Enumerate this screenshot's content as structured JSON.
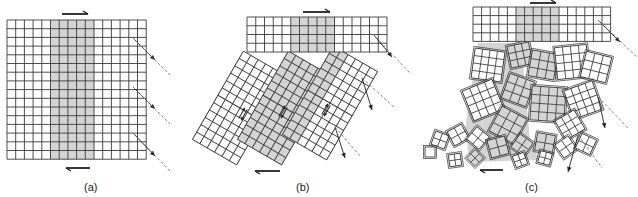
{
  "figure": {
    "colors": {
      "grid_line": "#3a3a3a",
      "shade": "#d4d4d4",
      "background": "#ffffff",
      "arrow": "#222222",
      "dashed": "#777777"
    },
    "panels": [
      {
        "id": "a",
        "label": "(a)",
        "label_pos": [
          84,
          181
        ],
        "description": "Intact rock mass grid with shaded vertical band; shear arrows top and bottom; three outward arrows on right with dashed extensions",
        "grid": {
          "x": 7,
          "y": 20,
          "cols": 16,
          "rows": 16,
          "cell": 8.7,
          "shade_cols": [
            5,
            10
          ]
        },
        "shear_arrows": [
          {
            "x1": 62,
            "y1": 14,
            "x2": 88,
            "y2": 14,
            "dir": "right"
          },
          {
            "x1": 90,
            "y1": 168,
            "x2": 66,
            "y2": 168,
            "dir": "left"
          }
        ],
        "vectors": [
          {
            "x1": 133,
            "y1": 38,
            "x2": 155,
            "y2": 60,
            "dx2": 170,
            "dy2": 75
          },
          {
            "x1": 133,
            "y1": 87,
            "x2": 155,
            "y2": 109,
            "dx2": 170,
            "dy2": 124
          },
          {
            "x1": 133,
            "y1": 133,
            "x2": 155,
            "y2": 156,
            "dx2": 170,
            "dy2": 171
          }
        ]
      },
      {
        "id": "b",
        "label": "(b)",
        "label_pos": [
          296,
          181
        ],
        "description": "Upper strip intact; lower part split into three tilted columns sliding relative to each other",
        "top_strip": {
          "x": 247,
          "y": 17,
          "cols": 16,
          "rows": 4,
          "cell": 8.75,
          "shade_cols": [
            5,
            10
          ]
        },
        "columns": [
          {
            "cx": 240,
            "cy": 108,
            "cols": 6,
            "rows": 12,
            "cell": 8.5,
            "angle": 30,
            "shade_cols": []
          },
          {
            "cx": 285,
            "cy": 108,
            "cols": 6,
            "rows": 12,
            "cell": 8.5,
            "angle": 30,
            "shade_cols": [
              0,
              6
            ]
          },
          {
            "cx": 330,
            "cy": 103,
            "cols": 6,
            "rows": 12,
            "cell": 8.5,
            "angle": 30,
            "shade_cols": [
              0,
              2
            ]
          }
        ],
        "slip_marks": [
          [
            243,
            114
          ],
          [
            283,
            112
          ],
          [
            326,
            110
          ]
        ],
        "shear_arrows": [
          {
            "x1": 303,
            "y1": 12,
            "x2": 330,
            "y2": 12,
            "dir": "right"
          },
          {
            "x1": 280,
            "y1": 171,
            "x2": 255,
            "y2": 171,
            "dir": "left"
          }
        ],
        "vectors": [
          {
            "x1": 373,
            "y1": 34,
            "x2": 392,
            "y2": 57,
            "dx2": 410,
            "dy2": 73
          },
          {
            "x1": 362,
            "y1": 78,
            "x2": 372,
            "y2": 110,
            "dx2": 395,
            "dy2": 108
          },
          {
            "x1": 335,
            "y1": 127,
            "x2": 345,
            "y2": 158,
            "dx2": 360,
            "dy2": 156
          }
        ]
      },
      {
        "id": "c",
        "label": "(c)",
        "label_pos": [
          525,
          181
        ],
        "description": "Upper block intact; lower rock mass fragmented into rotated blocks of varying size",
        "top_block": {
          "x": 473,
          "y": 7,
          "cols": 16,
          "rows": 4,
          "cell": 8.6,
          "shade_cols": [
            5,
            10
          ]
        },
        "fragments": [
          {
            "cx": 488,
            "cy": 65,
            "s": 30,
            "n": 4,
            "a": 8,
            "shade": false
          },
          {
            "cx": 520,
            "cy": 55,
            "s": 22,
            "n": 3,
            "a": -12,
            "shade": true
          },
          {
            "cx": 543,
            "cy": 65,
            "s": 26,
            "n": 3,
            "a": 10,
            "shade": true
          },
          {
            "cx": 572,
            "cy": 62,
            "s": 32,
            "n": 4,
            "a": -6,
            "shade": false
          },
          {
            "cx": 596,
            "cy": 67,
            "s": 26,
            "n": 3,
            "a": 14,
            "shade": false
          },
          {
            "cx": 483,
            "cy": 100,
            "s": 32,
            "n": 4,
            "a": -22,
            "shade": false
          },
          {
            "cx": 518,
            "cy": 90,
            "s": 26,
            "n": 3,
            "a": 20,
            "shade": true
          },
          {
            "cx": 548,
            "cy": 104,
            "s": 34,
            "n": 4,
            "a": 4,
            "shade": true
          },
          {
            "cx": 583,
            "cy": 100,
            "s": 30,
            "n": 4,
            "a": -20,
            "shade": false
          },
          {
            "cx": 508,
            "cy": 125,
            "s": 28,
            "n": 3,
            "a": 28,
            "shade": true
          },
          {
            "cx": 570,
            "cy": 125,
            "s": 22,
            "n": 3,
            "a": -30,
            "shade": false
          },
          {
            "cx": 440,
            "cy": 140,
            "s": 14,
            "n": 2,
            "a": 20,
            "shade": false
          },
          {
            "cx": 458,
            "cy": 135,
            "s": 16,
            "n": 2,
            "a": -28,
            "shade": false
          },
          {
            "cx": 478,
            "cy": 138,
            "s": 16,
            "n": 2,
            "a": 40,
            "shade": false
          },
          {
            "cx": 498,
            "cy": 147,
            "s": 18,
            "n": 2,
            "a": -15,
            "shade": true
          },
          {
            "cx": 522,
            "cy": 145,
            "s": 16,
            "n": 2,
            "a": 35,
            "shade": true
          },
          {
            "cx": 545,
            "cy": 143,
            "s": 18,
            "n": 2,
            "a": 10,
            "shade": true
          },
          {
            "cx": 566,
            "cy": 147,
            "s": 16,
            "n": 2,
            "a": -35,
            "shade": false
          },
          {
            "cx": 586,
            "cy": 144,
            "s": 16,
            "n": 2,
            "a": 25,
            "shade": false
          },
          {
            "cx": 430,
            "cy": 152,
            "s": 10,
            "n": 1,
            "a": 0,
            "shade": false
          },
          {
            "cx": 455,
            "cy": 160,
            "s": 12,
            "n": 2,
            "a": -8,
            "shade": false
          },
          {
            "cx": 475,
            "cy": 158,
            "s": 12,
            "n": 2,
            "a": 45,
            "shade": true
          },
          {
            "cx": 520,
            "cy": 160,
            "s": 12,
            "n": 2,
            "a": -20,
            "shade": false
          },
          {
            "cx": 545,
            "cy": 158,
            "s": 12,
            "n": 2,
            "a": 15,
            "shade": false
          }
        ],
        "shade_region": [
          [
            478,
            43
          ],
          [
            521,
            43
          ],
          [
            530,
            140
          ],
          [
            540,
            160
          ],
          [
            470,
            162
          ],
          [
            465,
            130
          ]
        ],
        "shear_arrows": [
          {
            "x1": 530,
            "y1": 3,
            "x2": 556,
            "y2": 3,
            "dir": "right"
          },
          {
            "x1": 503,
            "y1": 170,
            "x2": 480,
            "y2": 170,
            "dir": "left"
          }
        ],
        "vectors": [
          {
            "x1": 598,
            "y1": 20,
            "x2": 620,
            "y2": 42,
            "dx2": 638,
            "dy2": 58
          },
          {
            "x1": 598,
            "y1": 97,
            "x2": 605,
            "y2": 128,
            "dx2": 628,
            "dy2": 128
          },
          {
            "x1": 578,
            "y1": 135,
            "x2": 568,
            "y2": 172,
            "dx2": 602,
            "dy2": 168
          }
        ]
      }
    ]
  }
}
